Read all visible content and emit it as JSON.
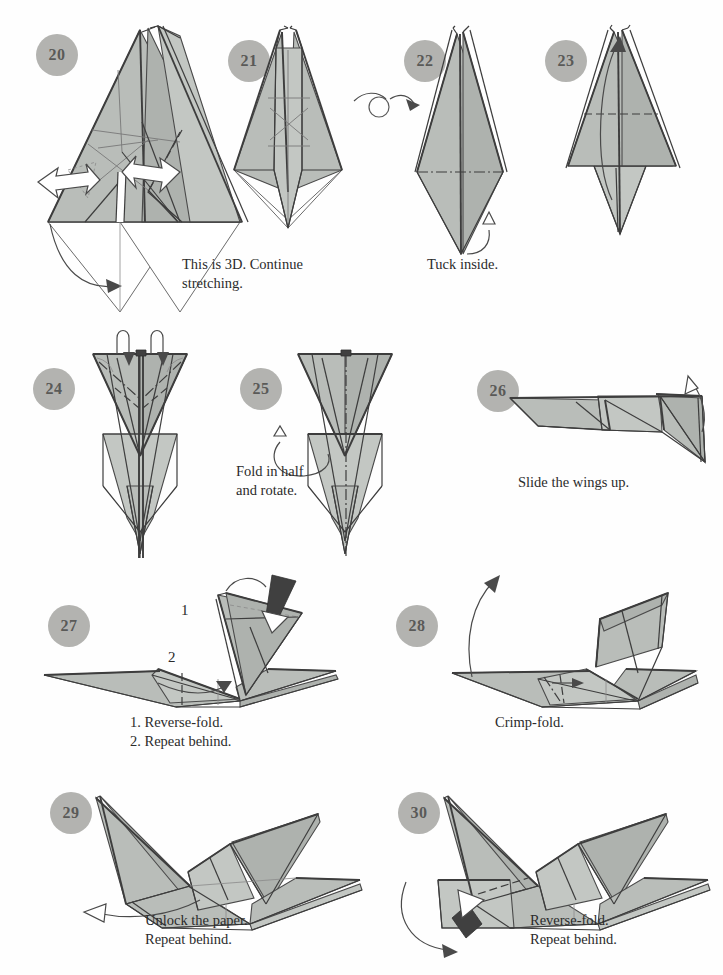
{
  "document": {
    "kind": "origami-instruction-diagram",
    "subject": "folded paper bird",
    "page_background": "#ffffff",
    "paper_fill_color": "#b9bdb9",
    "line_color": "#3d3d3d",
    "badge_fill_color": "#b3b3b0",
    "badge_text_color": "#5a5a58",
    "caption_text_color": "#2b2b2b"
  },
  "steps": [
    {
      "number": "20",
      "caption": "",
      "symbols": [
        "push-arrow-left",
        "push-arrow-right",
        "fold-arrow-down"
      ],
      "badge_x": 36,
      "badge_y": 34,
      "fig_x": 30,
      "fig_y": 28
    },
    {
      "number": "21",
      "caption": "This is 3D. Continue\nstretching.",
      "caption_x": 182,
      "caption_y": 255,
      "symbols": [
        "turn-over-symbol"
      ],
      "badge_x": 228,
      "badge_y": 40,
      "fig_x": 215,
      "fig_y": 28
    },
    {
      "number": "22",
      "caption": "Tuck inside.",
      "caption_x": 427,
      "caption_y": 255,
      "symbols": [
        "tuck-arrow"
      ],
      "badge_x": 404,
      "badge_y": 40,
      "fig_x": 395,
      "fig_y": 28
    },
    {
      "number": "23",
      "caption": "",
      "symbols": [
        "fold-up-arrow"
      ],
      "badge_x": 545,
      "badge_y": 40,
      "fig_x": 548,
      "fig_y": 28
    },
    {
      "number": "24",
      "caption": "",
      "symbols": [
        "pleat-arrow-left",
        "pleat-arrow-right",
        "mountain-crease",
        "valley-crease"
      ],
      "badge_x": 33,
      "badge_y": 368,
      "fig_x": 55,
      "fig_y": 336
    },
    {
      "number": "25",
      "caption": "Fold in half\nand rotate.",
      "caption_x": 236,
      "caption_y": 462,
      "symbols": [
        "rotate-arrow",
        "fold-in-half-crease"
      ],
      "badge_x": 240,
      "badge_y": 368,
      "fig_x": 255,
      "fig_y": 336
    },
    {
      "number": "26",
      "caption": "Slide the wings up.",
      "caption_x": 518,
      "caption_y": 473,
      "symbols": [
        "slide-up-arrow"
      ],
      "badge_x": 477,
      "badge_y": 370,
      "fig_x": 487,
      "fig_y": 380
    },
    {
      "number": "27",
      "caption": "1. Reverse-fold.\n2. Repeat behind.",
      "caption_x": 130,
      "caption_y": 717,
      "labels": [
        "1",
        "2"
      ],
      "label1_x": 181,
      "label1_y": 608,
      "label2_x": 168,
      "label2_y": 655,
      "symbols": [
        "solid-push-arrow",
        "reverse-fold-arrow",
        "repeat-behind-arrow"
      ],
      "badge_x": 48,
      "badge_y": 605,
      "fig_x": 40,
      "fig_y": 575
    },
    {
      "number": "28",
      "caption": "Crimp-fold.",
      "caption_x": 495,
      "caption_y": 717,
      "symbols": [
        "lift-arrow",
        "crimp-arrow",
        "crimp-crease"
      ],
      "badge_x": 396,
      "badge_y": 605,
      "fig_x": 400,
      "fig_y": 575
    },
    {
      "number": "29",
      "caption": "Unlock the paper.\nRepeat behind.",
      "caption_x": 145,
      "caption_y": 915,
      "symbols": [
        "hollow-pull-arrow"
      ],
      "badge_x": 50,
      "badge_y": 792,
      "fig_x": 70,
      "fig_y": 780
    },
    {
      "number": "30",
      "caption": "Reverse-fold.\nRepeat behind.",
      "caption_x": 530,
      "caption_y": 915,
      "symbols": [
        "solid-push-arrow",
        "swing-arrow",
        "valley-crease"
      ],
      "badge_x": 398,
      "badge_y": 792,
      "fig_x": 420,
      "fig_y": 780
    }
  ]
}
